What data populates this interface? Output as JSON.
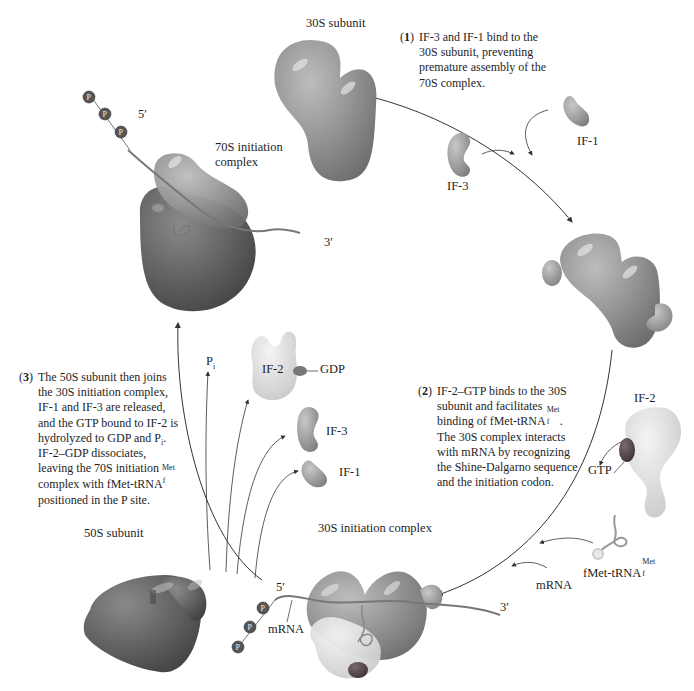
{
  "labels": {
    "subunit_30s": "30S subunit",
    "complex_70s_line1": "70S initiation",
    "complex_70s_line2": "complex",
    "if1_top": "IF-1",
    "if3_top": "IF-3",
    "if2_right": "IF-2",
    "gtp": "GTP",
    "trna_base": "fMet-tRNA",
    "trna_sup": "Met",
    "trna_sub": "f",
    "mrna_right": "mRNA",
    "complex_30s_init": "30S initiation complex",
    "mrna_bottom": "mRNA",
    "five_prime_bottom": "5′",
    "three_prime_bottom": "3′",
    "five_prime_top": "5′",
    "three_prime_top": "3′",
    "subunit_50s": "50S subunit",
    "if2_released": "IF-2",
    "gdp": "GDP",
    "if3_released": "IF-3",
    "if1_released": "IF-1",
    "pi_base": "P",
    "pi_sub": "i",
    "phosphate": "P"
  },
  "steps": [
    {
      "number": "1",
      "lines": [
        "IF-3 and IF-1 bind to the",
        "30S subunit, preventing",
        "premature assembly of the",
        "70S complex."
      ]
    },
    {
      "number": "2",
      "lines": [
        "IF-2–GTP binds to the 30S",
        "subunit and facilitates",
        "binding of fMet-tRNA",
        "The 30S complex interacts",
        "with mRNA by recognizing",
        "the Shine-Dalgarno sequence",
        "and the initiation codon."
      ],
      "trna_sup": "Met",
      "trna_sub": "f",
      "trna_after": "."
    },
    {
      "number": "3",
      "lines": [
        "The 50S subunit then joins",
        "the 30S initiation complex,",
        "IF-1 and IF-3 are released,",
        "and the GTP bound to IF-2 is",
        "hydrolyzed to GDP and P",
        "IF-2–GDP dissociates,",
        "leaving the 70S initiation",
        "complex with fMet-tRNA",
        "positioned in the P site."
      ],
      "pi_sub": "i",
      "pi_after": ".",
      "trna_sup": "Met",
      "trna_sub": "f"
    }
  ],
  "colors": {
    "subunit_30s": "#8c8c8c",
    "subunit_50s": "#5a5a5a",
    "if_factor": "#9a9a9a",
    "if2": "#dcdcdc",
    "gtp": "#5a4a52",
    "mrna": "#707070",
    "phosphate": "#5a5a5a",
    "arrow": "#333333"
  }
}
